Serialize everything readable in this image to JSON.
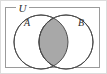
{
  "figure": {
    "kind": "venn-diagram"
  },
  "universe": {
    "label": "U",
    "border_color": "#9a9a9a"
  },
  "sets": [
    {
      "id": "A",
      "label": "A",
      "position": "left",
      "cx": 41,
      "cy": 42,
      "r": 27,
      "fill": "#ffffff",
      "stroke": "#4d4d4d",
      "label_x": 27,
      "label_y": 26
    },
    {
      "id": "B",
      "label": "B",
      "position": "right",
      "cx": 66,
      "cy": 42,
      "r": 27,
      "fill": "#ffffff",
      "stroke": "#4d4d4d",
      "label_x": 81,
      "label_y": 26
    }
  ],
  "shaded_region": {
    "name": "A-intersect-B",
    "fill": "#a8a8a8",
    "stroke": "#3d3d3d"
  },
  "canvas": {
    "width": 107,
    "height": 74,
    "background": "#ffffff",
    "edge_color": "#d8d8d8"
  }
}
